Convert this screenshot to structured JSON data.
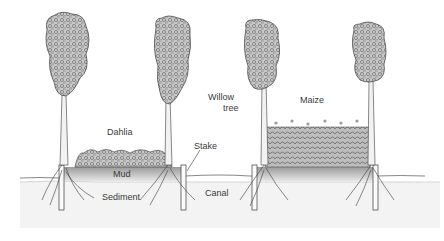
{
  "diagram": {
    "labels": {
      "dahlia": "Dahlia",
      "mud": "Mud",
      "sediment": "Sediment",
      "stake": "Stake",
      "canal": "Canal",
      "willow_line1": "Willow",
      "willow_line2": "tree",
      "maize": "Maize"
    },
    "colors": {
      "ink": "#3a3a3a",
      "foliage": "#8a8a8a",
      "mud": "#b9b9b9",
      "sediment": "#f1f1f1",
      "background": "#ffffff"
    },
    "plots": [
      {
        "crop": "Dahlia",
        "x_start": 75,
        "x_end": 172
      },
      {
        "crop": "Maize",
        "x_start": 265,
        "x_end": 370
      }
    ],
    "trees": [
      {
        "name": "willow-tree-1",
        "x": 62
      },
      {
        "name": "willow-tree-2",
        "x": 167
      },
      {
        "name": "willow-tree-3",
        "x": 263
      },
      {
        "name": "willow-tree-4",
        "x": 370
      }
    ]
  }
}
